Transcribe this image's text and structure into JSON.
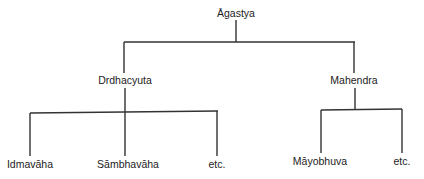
{
  "diagram": {
    "type": "family-tree",
    "line_color": "#333333",
    "background": "#ffffff",
    "root": {
      "label": "Āgastya",
      "children": [
        {
          "label": "Drdhacyuta",
          "children": [
            {
              "label": "Idmavāha"
            },
            {
              "label": "Sāmbhavāha"
            },
            {
              "label": "etc."
            }
          ]
        },
        {
          "label": "Mahendra",
          "children": [
            {
              "label": "Māyobhuva"
            },
            {
              "label": "etc."
            }
          ]
        }
      ]
    }
  },
  "nodes": {
    "agastya": "Āgastya",
    "drdhacyuta": "Drdhacyuta",
    "mahendra": "Mahendra",
    "idmavaha": "Idmavāha",
    "sambhavaha": "Sāmbhavāha",
    "etc_left": "etc.",
    "mayobhuva": "Māyobhuva",
    "etc_right": "etc."
  }
}
